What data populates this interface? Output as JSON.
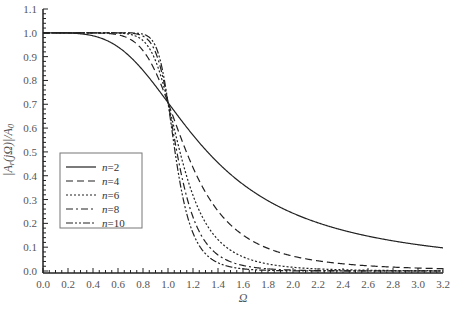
{
  "chart_data": {
    "type": "line",
    "title": "",
    "xlabel": "Ω",
    "ylabel": "|A_r(jΩ)|/A_0",
    "xlim": [
      0.0,
      3.2
    ],
    "ylim": [
      0.0,
      1.1
    ],
    "x_ticks": [
      "0.0",
      "0.2",
      "0.4",
      "0.6",
      "0.8",
      "1.0",
      "1.2",
      "1.4",
      "1.6",
      "1.8",
      "2.0",
      "2.2",
      "2.4",
      "2.6",
      "2.8",
      "3.0",
      "3.2"
    ],
    "y_ticks": [
      "0.0",
      "0.1",
      "0.2",
      "0.3",
      "0.4",
      "0.5",
      "0.6",
      "0.7",
      "0.8",
      "0.9",
      "1.0",
      "1.1"
    ],
    "grid": false,
    "legend_position": "left-middle",
    "series": [
      {
        "name": "n=2",
        "n": 2,
        "dash": "",
        "x": [
          0.0,
          0.4,
          0.8,
          1.0,
          1.2,
          1.6,
          2.0,
          2.4,
          2.8,
          3.2
        ],
        "values": [
          1.0,
          0.987,
          0.842,
          0.707,
          0.57,
          0.364,
          0.243,
          0.171,
          0.127,
          0.097
        ]
      },
      {
        "name": "n=4",
        "n": 4,
        "dash": "7,4",
        "x": [
          0.0,
          0.4,
          0.8,
          1.0,
          1.2,
          1.6,
          2.0,
          2.4,
          2.8,
          3.2
        ],
        "values": [
          1.0,
          1.0,
          0.969,
          0.707,
          0.375,
          0.151,
          0.062,
          0.03,
          0.016,
          0.01
        ]
      },
      {
        "name": "n=6",
        "n": 6,
        "dash": "2,2",
        "x": [
          0.0,
          0.4,
          0.8,
          1.0,
          1.2,
          1.6,
          2.0,
          2.4,
          2.8,
          3.2
        ],
        "values": [
          1.0,
          1.0,
          0.993,
          0.707,
          0.302,
          0.059,
          0.016,
          0.005,
          0.002,
          0.001
        ]
      },
      {
        "name": "n=8",
        "n": 8,
        "dash": "7,3,2,3",
        "x": [
          0.0,
          0.4,
          0.8,
          1.0,
          1.2,
          1.6,
          2.0,
          2.4,
          2.8,
          3.2
        ],
        "values": [
          1.0,
          1.0,
          0.999,
          0.707,
          0.233,
          0.023,
          0.004,
          0.001,
          0.0,
          0.0
        ]
      },
      {
        "name": "n=10",
        "n": 10,
        "dash": "7,2,2,2,2,2",
        "x": [
          0.0,
          0.4,
          0.8,
          1.0,
          1.2,
          1.6,
          2.0,
          2.4,
          2.8,
          3.2
        ],
        "values": [
          1.0,
          1.0,
          1.0,
          0.707,
          0.16,
          0.009,
          0.001,
          0.0,
          0.0,
          0.0
        ]
      }
    ]
  },
  "legend": {
    "items": [
      {
        "label_var": "n",
        "label_val": "=2"
      },
      {
        "label_var": "n",
        "label_val": "=4"
      },
      {
        "label_var": "n",
        "label_val": "=6"
      },
      {
        "label_var": "n",
        "label_val": "=8"
      },
      {
        "label_var": "n",
        "label_val": "=10"
      }
    ]
  }
}
